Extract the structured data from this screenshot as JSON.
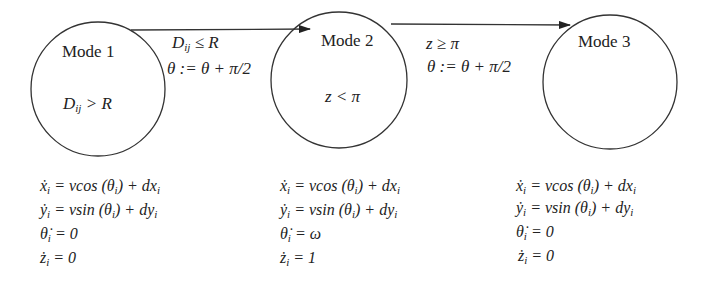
{
  "diagram": {
    "type": "hybrid-automaton",
    "modes": [
      {
        "id": "mode1",
        "label": "Mode 1",
        "invariant": "D_ij > R",
        "invariant_parts": {
          "pre": "D",
          "sub": "ij",
          "post": " > R"
        },
        "dynamics": [
          "ẋ_i = vcos (θ_i) + dx_i",
          "ẏ_i = vsin (θ_i) + dy_i",
          "θ̇_i = 0",
          "ż_i = 0"
        ],
        "dyn_display": {
          "x": {
            "lhs": "ẋ",
            "rhs": " = vcos (θ",
            "rhs2": ") + dx"
          },
          "y": {
            "lhs": "ẏ",
            "rhs": " = vsin (θ",
            "rhs2": ") + dy"
          },
          "theta": {
            "lhs": "θ̇",
            "rhs": " = 0"
          },
          "z": {
            "lhs": "ż",
            "rhs": " = 0"
          }
        }
      },
      {
        "id": "mode2",
        "label": "Mode 2",
        "invariant": "z < π",
        "dynamics": [
          "ẋ_i = vcos (θ_i) + dx_i",
          "ẏ_i = vsin (θ_i) + dy_i",
          "θ̇_i = ω",
          "ż_i = 1"
        ],
        "dyn_display": {
          "x": {
            "lhs": "ẋ",
            "rhs": " = vcos (θ",
            "rhs2": ") + dx"
          },
          "y": {
            "lhs": "ẏ",
            "rhs": " = vsin (θ",
            "rhs2": ") + dy"
          },
          "theta": {
            "lhs": "θ̇",
            "rhs": " = ω"
          },
          "z": {
            "lhs": "ż",
            "rhs": " = 1"
          }
        }
      },
      {
        "id": "mode3",
        "label": "Mode 3",
        "invariant": "",
        "dynamics": [
          "ẋ_i = vcos (θ_i) + dx_i",
          "ẏ_i = vsin (θ_i) + dy_i",
          "θ̇_i = 0",
          "ż_i = 0"
        ],
        "dyn_display": {
          "x": {
            "lhs": "ẋ",
            "rhs": " = vcos (θ",
            "rhs2": ") + dx"
          },
          "y": {
            "lhs": "ẏ",
            "rhs": " = vsin (θ",
            "rhs2": ") + dy"
          },
          "theta": {
            "lhs": "θ̇",
            "rhs": " = 0"
          },
          "z": {
            "lhs": "ż",
            "rhs": " = 0"
          }
        }
      }
    ],
    "transitions": [
      {
        "from": "mode1",
        "to": "mode2",
        "guard": "D_ij ≤ R",
        "guard_parts": {
          "pre": "D",
          "sub": "ij",
          "post": " ≤  R"
        },
        "reset": "θ := θ + π/2"
      },
      {
        "from": "mode2",
        "to": "mode3",
        "guard": "z ≥ π",
        "reset": "θ := θ + π/2"
      }
    ],
    "subscript": "i",
    "colors": {
      "stroke": "#333333",
      "text": "#222222",
      "background": "#ffffff"
    }
  }
}
